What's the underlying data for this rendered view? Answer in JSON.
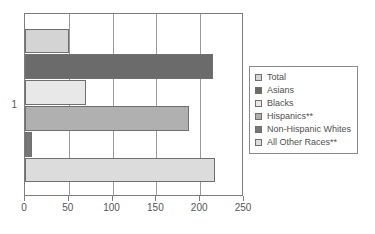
{
  "chart_data": {
    "type": "bar",
    "orientation": "horizontal",
    "title": "",
    "xlabel": "",
    "ylabel": "",
    "categories": [
      "1"
    ],
    "xlim": [
      0,
      250
    ],
    "xticks": [
      0,
      50,
      100,
      150,
      200,
      250
    ],
    "xtick_labels": [
      "0",
      "50",
      "100",
      "150",
      "200",
      "250"
    ],
    "grid": true,
    "grid_axis": "x",
    "legend_position": "right",
    "series": [
      {
        "name": "Total",
        "values": [
          50
        ],
        "color": "#d4d4d4"
      },
      {
        "name": "Asians",
        "values": [
          215
        ],
        "color": "#6b6b6b"
      },
      {
        "name": "Blacks",
        "values": [
          70
        ],
        "color": "#e8e8e8"
      },
      {
        "name": "Hispanics**",
        "values": [
          187
        ],
        "color": "#b0b0b0"
      },
      {
        "name": "Non-Hispanic Whites",
        "values": [
          8
        ],
        "color": "#777777"
      },
      {
        "name": "All Other Races**",
        "values": [
          217
        ],
        "color": "#dcdcdc"
      }
    ]
  },
  "legend": {
    "items": [
      {
        "label": "Total"
      },
      {
        "label": "Asians"
      },
      {
        "label": "Blacks"
      },
      {
        "label": "Hispanics**"
      },
      {
        "label": "Non-Hispanic Whites"
      },
      {
        "label": "All Other Races**"
      }
    ]
  }
}
